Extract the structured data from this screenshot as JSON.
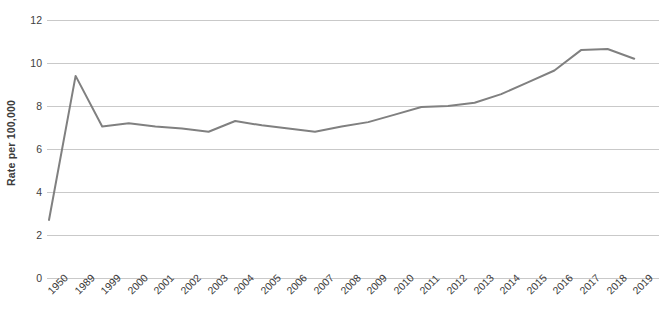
{
  "chart_data": {
    "type": "line",
    "title": "",
    "subtitle": "",
    "xlabel": "",
    "ylabel": "Rate per 100,000",
    "ylim": [
      0,
      12
    ],
    "y_ticks": [
      0,
      2,
      4,
      6,
      8,
      10,
      12
    ],
    "grid": true,
    "legend": "none",
    "line_color": "#808080",
    "background_color": "#ffffff",
    "gridline_color": "#c9c9c9",
    "categories": [
      "1950",
      "1989",
      "1999",
      "2000",
      "2001",
      "2002",
      "2003",
      "2004",
      "2005",
      "2006",
      "2007",
      "2008",
      "2009",
      "2010",
      "2011",
      "2012",
      "2013",
      "2014",
      "2015",
      "2016",
      "2017",
      "2018",
      "2019"
    ],
    "values": [
      2.7,
      9.4,
      7.05,
      7.2,
      7.05,
      6.95,
      6.8,
      7.3,
      7.1,
      6.95,
      6.8,
      7.05,
      7.25,
      7.6,
      7.95,
      8.0,
      8.15,
      8.55,
      9.1,
      9.65,
      10.6,
      10.65,
      10.2
    ],
    "series": [
      {
        "name": "Rate per 100,000",
        "values": [
          2.7,
          9.4,
          7.05,
          7.2,
          7.05,
          6.95,
          6.8,
          7.3,
          7.1,
          6.95,
          6.8,
          7.05,
          7.25,
          7.6,
          7.95,
          8.0,
          8.15,
          8.55,
          9.1,
          9.65,
          10.6,
          10.65,
          10.2
        ]
      }
    ]
  }
}
